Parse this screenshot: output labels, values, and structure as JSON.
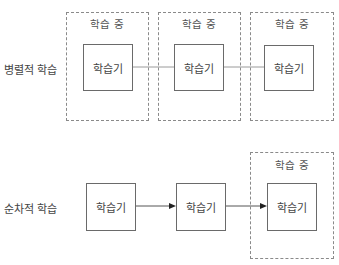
{
  "parallel": {
    "label": "병렬적 학습",
    "groups": [
      {
        "caption": "학습 중",
        "learner": "학습기"
      },
      {
        "caption": "학습 중",
        "learner": "학습기"
      },
      {
        "caption": "학습 중",
        "learner": "학습기"
      }
    ]
  },
  "sequential": {
    "label": "순차적 학습",
    "learners": [
      "학습기",
      "학습기",
      "학습기"
    ],
    "active_caption": "학습 중"
  }
}
